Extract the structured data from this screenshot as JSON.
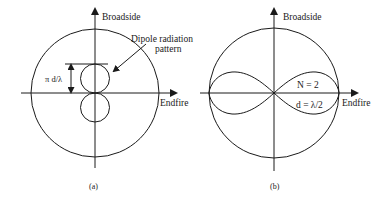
{
  "panels": [
    {
      "id": "a",
      "caption": "(a)",
      "axis_vertical_label": "Broadside",
      "axis_horizontal_label": "Endfire",
      "annotation_line1": "Dipole radiation",
      "annotation_line2": "pattern",
      "dimension_label": "π d/λ"
    },
    {
      "id": "b",
      "caption": "(b)",
      "axis_vertical_label": "Broadside",
      "axis_horizontal_label": "Endfire",
      "param_n": "N = 2",
      "param_d": "d = λ/2"
    }
  ],
  "colors": {
    "stroke": "#1a1a1a",
    "background": "#ffffff"
  }
}
